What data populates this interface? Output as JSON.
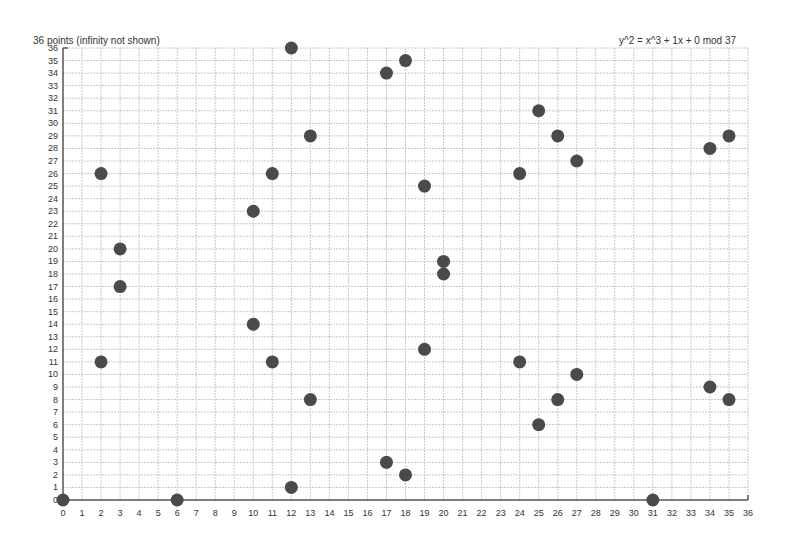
{
  "header": {
    "left_title": "36 points (infinity not shown)",
    "right_title": "y^2 = x^3 + 1x + 0 mod 37"
  },
  "colors": {
    "point": "#4a4a4a",
    "axis": "#555555",
    "grid": "#c8c8c8",
    "text": "#333333"
  },
  "chart_data": {
    "type": "scatter",
    "title": "y^2 = x^3 + 1x + 0 mod 37",
    "subtitle": "36 points (infinity not shown)",
    "xlabel": "",
    "ylabel": "",
    "xlim": [
      0,
      36
    ],
    "ylim": [
      0,
      36
    ],
    "xticks": [
      0,
      1,
      2,
      3,
      4,
      5,
      6,
      7,
      8,
      9,
      10,
      11,
      12,
      13,
      14,
      15,
      16,
      17,
      18,
      19,
      20,
      21,
      22,
      23,
      24,
      25,
      26,
      27,
      28,
      29,
      30,
      31,
      32,
      33,
      34,
      35,
      36
    ],
    "yticks": [
      0,
      1,
      2,
      3,
      4,
      5,
      6,
      7,
      8,
      9,
      10,
      11,
      12,
      13,
      14,
      15,
      16,
      17,
      18,
      19,
      20,
      21,
      22,
      23,
      24,
      25,
      26,
      27,
      28,
      29,
      30,
      31,
      32,
      33,
      34,
      35,
      36
    ],
    "grid": true,
    "points": [
      [
        0,
        0
      ],
      [
        2,
        11
      ],
      [
        2,
        26
      ],
      [
        3,
        17
      ],
      [
        3,
        20
      ],
      [
        6,
        0
      ],
      [
        10,
        14
      ],
      [
        10,
        23
      ],
      [
        11,
        11
      ],
      [
        11,
        26
      ],
      [
        12,
        1
      ],
      [
        12,
        36
      ],
      [
        13,
        8
      ],
      [
        13,
        29
      ],
      [
        17,
        3
      ],
      [
        17,
        34
      ],
      [
        18,
        2
      ],
      [
        18,
        35
      ],
      [
        19,
        12
      ],
      [
        19,
        25
      ],
      [
        20,
        18
      ],
      [
        20,
        19
      ],
      [
        24,
        11
      ],
      [
        24,
        26
      ],
      [
        25,
        6
      ],
      [
        25,
        31
      ],
      [
        26,
        8
      ],
      [
        26,
        29
      ],
      [
        27,
        10
      ],
      [
        27,
        27
      ],
      [
        31,
        0
      ],
      [
        34,
        9
      ],
      [
        34,
        28
      ],
      [
        35,
        8
      ],
      [
        35,
        29
      ]
    ]
  }
}
